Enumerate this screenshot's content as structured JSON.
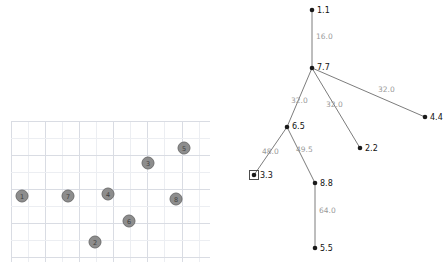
{
  "figure": {
    "title": "",
    "background_color": "#ffffff",
    "width": 445,
    "height": 270
  },
  "scatter_panel": {
    "name": "grid-scatter-plot",
    "grid": {
      "visible": true,
      "major_color": "#d9dce3",
      "minor_color": "#eceef2",
      "x_start": 11,
      "x_end": 210,
      "y_start": 121,
      "y_end": 262,
      "spacing": 17.1
    },
    "node_fill": "#8d8d8d",
    "node_stroke": "#6f6f6f",
    "node_radius": 6,
    "nodes": [
      {
        "label": "1",
        "x": 22,
        "y": 196
      },
      {
        "label": "7",
        "x": 68,
        "y": 196
      },
      {
        "label": "4",
        "x": 108,
        "y": 194
      },
      {
        "label": "2",
        "x": 95,
        "y": 242
      },
      {
        "label": "6",
        "x": 129,
        "y": 221
      },
      {
        "label": "3",
        "x": 148,
        "y": 163
      },
      {
        "label": "5",
        "x": 184,
        "y": 148
      },
      {
        "label": "8",
        "x": 176,
        "y": 199
      }
    ]
  },
  "tree_panel": {
    "name": "weighted-tree-diagram",
    "node_color": "#1a1a1a",
    "edge_color": "#6d6d6d",
    "edge_label_color": "#9a9a9a",
    "node_label_color": "#111111",
    "selected_node": "3.3",
    "nodes": [
      {
        "label": "1.1",
        "x": 312,
        "y": 10,
        "label_dx": 5,
        "label_dy": 0,
        "selected": false
      },
      {
        "label": "7.7",
        "x": 312,
        "y": 68,
        "label_dx": 5,
        "label_dy": -1,
        "selected": false
      },
      {
        "label": "4.4",
        "x": 425,
        "y": 117,
        "label_dx": 5,
        "label_dy": 0,
        "selected": false
      },
      {
        "label": "6.5",
        "x": 287,
        "y": 127,
        "label_dx": 5,
        "label_dy": -1,
        "selected": false
      },
      {
        "label": "2.2",
        "x": 360,
        "y": 148,
        "label_dx": 5,
        "label_dy": 0,
        "selected": false
      },
      {
        "label": "3.3",
        "x": 254,
        "y": 175,
        "label_dx": 6,
        "label_dy": 0,
        "selected": true
      },
      {
        "label": "8.8",
        "x": 315,
        "y": 183,
        "label_dx": 5,
        "label_dy": 0,
        "selected": false
      },
      {
        "label": "5.5",
        "x": 315,
        "y": 248,
        "label_dx": 5,
        "label_dy": 0,
        "selected": false
      }
    ],
    "edges": [
      {
        "from": "7.7",
        "to": "1.1",
        "weight": "16.0",
        "label_x": 316,
        "label_y": 36
      },
      {
        "from": "7.7",
        "to": "6.5",
        "weight": "32.0",
        "label_x": 291,
        "label_y": 100
      },
      {
        "from": "7.7",
        "to": "2.2",
        "weight": "32.0",
        "label_x": 326,
        "label_y": 104
      },
      {
        "from": "7.7",
        "to": "4.4",
        "weight": "32.0",
        "label_x": 378,
        "label_y": 89
      },
      {
        "from": "6.5",
        "to": "3.3",
        "weight": "48.0",
        "label_x": 262,
        "label_y": 151
      },
      {
        "from": "6.5",
        "to": "8.8",
        "weight": "49.5",
        "label_x": 296,
        "label_y": 149
      },
      {
        "from": "8.8",
        "to": "5.5",
        "weight": "64.0",
        "label_x": 319,
        "label_y": 210
      }
    ]
  }
}
